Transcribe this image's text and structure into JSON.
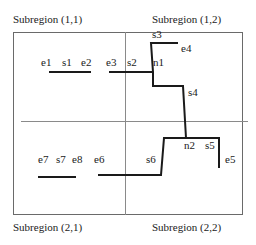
{
  "diagram": {
    "subregions": [
      {
        "id": "11",
        "label": "Subregion (1,1)"
      },
      {
        "id": "12",
        "label": "Subregion (1,2)"
      },
      {
        "id": "21",
        "label": "Subregion (2,1)"
      },
      {
        "id": "22",
        "label": "Subregion (2,2)"
      }
    ],
    "point_labels": {
      "e1": "e1",
      "s1": "s1",
      "e2": "e2",
      "e3": "e3",
      "s2": "s2",
      "n1": "n1",
      "s3": "s3",
      "e4": "e4",
      "s4": "s4",
      "n2": "n2",
      "s5": "s5",
      "e5": "e5",
      "s6": "s6",
      "e6": "e6",
      "e7": "e7",
      "s7": "s7",
      "e8": "e8"
    },
    "colors": {
      "segment": "#1a1a1a",
      "border": "#6a6a6a",
      "divider": "#8a8a8a",
      "background": "#ffffff"
    }
  }
}
